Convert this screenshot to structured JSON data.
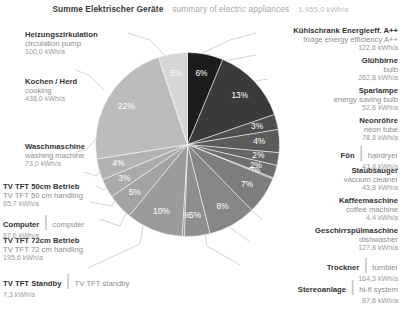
{
  "header": {
    "title_de": "Summe Elektrischer Geräte",
    "title_en": "summary of electric appliances",
    "total": "1.955,0 kWh/a"
  },
  "units": "kWh/a",
  "chart_data": {
    "type": "pie",
    "total": 1955.0,
    "unit": "kWh/a",
    "legend_position": "outside-both-sides",
    "start_angle_deg": 0,
    "direction": "clockwise",
    "categories": [
      "Kühlschrank Energieeff. A++",
      "Glühbirne",
      "Sparlampe",
      "Neonröhre",
      "Fön",
      "Staubsauger",
      "Kaffeemaschine",
      "Geschirrspülmaschine",
      "Trockner",
      "Stereoanlage",
      "TV TFT Standby",
      "TV TFT 72cm Betrieb",
      "Computer",
      "TV TFT 50cm Betrieb",
      "Waschmaschine",
      "Kochen / Herd",
      "Heizungszirkulation"
    ],
    "values": [
      122.6,
      262.8,
      52.6,
      78.8,
      43.8,
      43.8,
      4.4,
      127.8,
      164.3,
      87.6,
      7.3,
      195.6,
      87.6,
      65.7,
      73.0,
      438.0,
      100.0
    ],
    "percent_labels": [
      "6%",
      "13%",
      "3%",
      "4%",
      "2%",
      "2%",
      "0%",
      "7%",
      "8%",
      "5%",
      "0%",
      "10%",
      "5%",
      "3%",
      "4%",
      "22%",
      "5%"
    ],
    "colors": [
      "#1c1c1c",
      "#3a3a3a",
      "#4e4e4e",
      "#5b5b5b",
      "#666666",
      "#6f6f6f",
      "#767676",
      "#7d7d7d",
      "#868686",
      "#8e8e8e",
      "#949494",
      "#9b9b9b",
      "#a3a3a3",
      "#aaaaaa",
      "#b2b2b2",
      "#bcbcbc",
      "#d6d6d6"
    ]
  },
  "slices": [
    {
      "de": "Kühlschrank Energieeff. A++",
      "en": "fridge energy efficiency A++",
      "val": "122,6 kWh/a",
      "pct": "6%",
      "inline": false
    },
    {
      "de": "Glühbirne",
      "en": "bulb",
      "val": "262,8 kWh/a",
      "pct": "13%",
      "inline": false
    },
    {
      "de": "Sparlampe",
      "en": "energy saving bulb",
      "val": "52,6 kWh/a",
      "pct": "3%",
      "inline": false
    },
    {
      "de": "Neonröhre",
      "en": "neon tube",
      "val": "78,8 kWh/a",
      "pct": "4%",
      "inline": false
    },
    {
      "de": "Fön",
      "en": "hairdryer",
      "val": "43,8 kWh/a",
      "pct": "2%",
      "inline": true
    },
    {
      "de": "Staubsauger",
      "en": "vacuum cleaner",
      "val": "43,8 kWh/a",
      "pct": "2%",
      "inline": false
    },
    {
      "de": "Kaffeemaschine",
      "en": "coffee machine",
      "val": "4,4 kWh/a",
      "pct": "0%",
      "inline": false
    },
    {
      "de": "Geschirrspülmaschine",
      "en": "dishwasher",
      "val": "127,8 kWh/a",
      "pct": "7%",
      "inline": false
    },
    {
      "de": "Trockner",
      "en": "tumbler",
      "val": "164,3 kWh/a",
      "pct": "8%",
      "inline": true
    },
    {
      "de": "Stereoanlage",
      "en": "hi-fi system",
      "val": "87,6 kWh/a",
      "pct": "5%",
      "inline": true
    },
    {
      "de": "TV TFT Standby",
      "en": "TV TFT standby",
      "val": "7,3 kWh/a",
      "pct": "0%",
      "inline": true
    },
    {
      "de": "TV TFT 72cm Betrieb",
      "en": "TV TFT 72 cm handling",
      "val": "195,6 kWh/a",
      "pct": "10%",
      "inline": false
    },
    {
      "de": "Computer",
      "en": "computer",
      "val": "87,6 kWh/a",
      "pct": "5%",
      "inline": true
    },
    {
      "de": "TV TFT 50cm Betrieb",
      "en": "TV TFT 50 cm handling",
      "val": "65,7 kWh/a",
      "pct": "3%",
      "inline": false
    },
    {
      "de": "Waschmaschine",
      "en": "washing machine",
      "val": "73,0 kWh/a",
      "pct": "4%",
      "inline": false
    },
    {
      "de": "Kochen / Herd",
      "en": "cooking",
      "val": "438,0 kWh/a",
      "pct": "22%",
      "inline": false
    },
    {
      "de": "Heizungszirkulation",
      "en": "circulation pump",
      "val": "100,0 kWh/a",
      "pct": "5%",
      "inline": false
    }
  ]
}
